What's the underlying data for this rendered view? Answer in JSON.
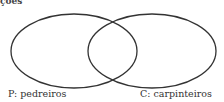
{
  "header": {
    "fragment": "ções"
  },
  "diagram": {
    "type": "venn",
    "sets": [
      {
        "id": "P",
        "label": "P:  pedreiros",
        "cx": 74,
        "cy": 51,
        "rx": 63,
        "ry": 37
      },
      {
        "id": "C",
        "label": "C:  carpinteiros",
        "cx": 152,
        "cy": 51,
        "rx": 64,
        "ry": 37
      }
    ],
    "stroke_color": "#333333"
  }
}
